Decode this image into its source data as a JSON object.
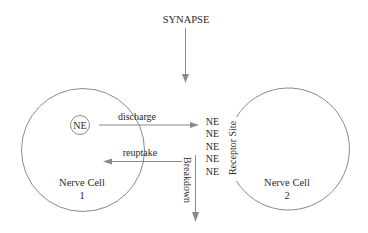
{
  "title": "SYNAPSE",
  "cells": [
    {
      "id": "cell-1",
      "label_line1": "Nerve Cell",
      "label_line2": "1"
    },
    {
      "id": "cell-2",
      "label_line1": "Nerve Cell",
      "label_line2": "2"
    }
  ],
  "vesicle": {
    "label": "NE"
  },
  "arrows": {
    "discharge": "discharge",
    "reuptake": "reuptake",
    "breakdown": "Breakdown"
  },
  "cleft_molecules": [
    "NE",
    "NE",
    "NE",
    "NE",
    "NE"
  ],
  "receptor": {
    "label": "Receptor Site"
  },
  "colors": {
    "line": "#8a8a8a",
    "text": "#2a2a2a",
    "background": "#ffffff"
  }
}
